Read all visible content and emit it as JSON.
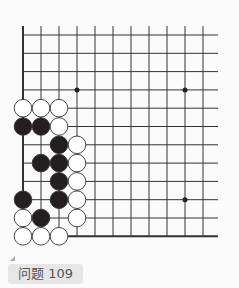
{
  "caption": "问题 109",
  "board": {
    "origin_x": 23,
    "origin_y": 35,
    "spacing_x": 18,
    "spacing_y": 18.3,
    "cols": 11,
    "rows": 12,
    "top_line_y": 26,
    "right_end_x": 218,
    "left_edge": true,
    "bottom_edge": true,
    "star_points": [
      [
        3,
        3
      ],
      [
        9,
        3
      ],
      [
        9,
        9
      ]
    ],
    "stones": [
      {
        "c": 0,
        "r": 4,
        "color": "white"
      },
      {
        "c": 1,
        "r": 4,
        "color": "white"
      },
      {
        "c": 2,
        "r": 4,
        "color": "white"
      },
      {
        "c": 0,
        "r": 5,
        "color": "black"
      },
      {
        "c": 1,
        "r": 5,
        "color": "black"
      },
      {
        "c": 2,
        "r": 5,
        "color": "white"
      },
      {
        "c": 2,
        "r": 6,
        "color": "black"
      },
      {
        "c": 3,
        "r": 6,
        "color": "white"
      },
      {
        "c": 1,
        "r": 7,
        "color": "black"
      },
      {
        "c": 2,
        "r": 7,
        "color": "black"
      },
      {
        "c": 3,
        "r": 7,
        "color": "white"
      },
      {
        "c": 2,
        "r": 8,
        "color": "black"
      },
      {
        "c": 3,
        "r": 8,
        "color": "white"
      },
      {
        "c": 0,
        "r": 9,
        "color": "black"
      },
      {
        "c": 2,
        "r": 9,
        "color": "black"
      },
      {
        "c": 3,
        "r": 9,
        "color": "white"
      },
      {
        "c": 0,
        "r": 10,
        "color": "white"
      },
      {
        "c": 1,
        "r": 10,
        "color": "black"
      },
      {
        "c": 3,
        "r": 10,
        "color": "white"
      },
      {
        "c": 0,
        "r": 11,
        "color": "white"
      },
      {
        "c": 1,
        "r": 11,
        "color": "white"
      },
      {
        "c": 2,
        "r": 11,
        "color": "white"
      }
    ]
  }
}
